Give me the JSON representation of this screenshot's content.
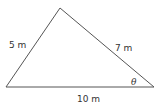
{
  "diagram": {
    "type": "triangle",
    "vertices": {
      "apex": [
        60,
        8
      ],
      "bottom_left": [
        6,
        87
      ],
      "bottom_right": [
        154,
        87
      ]
    },
    "sides": {
      "left": {
        "label": "5 m",
        "length": 5
      },
      "right": {
        "label": "7 m",
        "length": 7
      },
      "base": {
        "label": "10 m",
        "length": 10
      }
    },
    "angle": {
      "label": "θ",
      "vertex": "bottom_right"
    },
    "colors": {
      "stroke": "#555555",
      "text": "#333333",
      "background": "#ffffff"
    }
  }
}
